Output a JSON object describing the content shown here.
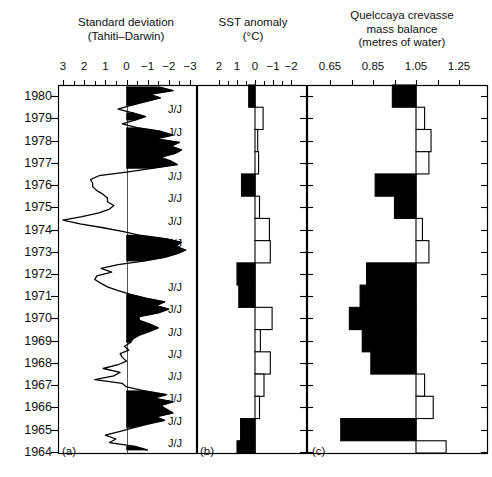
{
  "figure": {
    "panels": [
      {
        "id": "a",
        "label": "(a)",
        "title_line1": "Standard deviation",
        "title_line2": "(Tahiti–Darwin)",
        "title_line3": "",
        "axis_ticks": [
          "3",
          "2",
          "1",
          "0",
          "−1",
          "−2",
          "−3"
        ],
        "axis_values": [
          3,
          2,
          1,
          0,
          -1,
          -2,
          -3
        ],
        "axis_reversed": true,
        "baseline": 0,
        "plot_type": "line-fill"
      },
      {
        "id": "b",
        "label": "(b)",
        "title_line1": "SST anomaly",
        "title_line2": "(°C)",
        "title_line3": "",
        "axis_ticks": [
          "2",
          "1",
          "0",
          "−1",
          "−2"
        ],
        "axis_values": [
          2,
          1,
          0,
          -1,
          -2
        ],
        "axis_reversed": true,
        "baseline": 0,
        "plot_type": "step-bar"
      },
      {
        "id": "c",
        "label": "(c)",
        "title_line1": "Quelccaya crevasse",
        "title_line2": "mass balance",
        "title_line3": "(metres of water)",
        "axis_ticks": [
          "0.65",
          "0.85",
          "1.05",
          "1.25"
        ],
        "axis_values": [
          0.65,
          0.85,
          1.05,
          1.25
        ],
        "axis_reversed": false,
        "baseline": 1.05,
        "plot_type": "step-bar"
      }
    ],
    "years": [
      1980,
      1979,
      1978,
      1977,
      1976,
      1975,
      1974,
      1973,
      1972,
      1971,
      1970,
      1969,
      1968,
      1967,
      1966,
      1965,
      1964
    ],
    "jj_marker_label": "J/J",
    "jj_marker_years": [
      1979,
      1978,
      1976,
      1975,
      1974,
      1973,
      1971,
      1970,
      1969,
      1968,
      1967,
      1966,
      1965,
      1964
    ],
    "colors": {
      "ink": "#000000",
      "paper": "#ffffff",
      "fill_positive": "#000000",
      "fill_negative": "#ffffff"
    }
  },
  "chart_data": [
    {
      "type": "line",
      "panel": "a",
      "title": "Standard deviation (Tahiti–Darwin)",
      "xlabel": "Standard deviation",
      "ylabel": "Year",
      "xlim": [
        3,
        -3
      ],
      "ylim": [
        1964,
        1980.5
      ],
      "grid": false,
      "baseline": 0,
      "note": "Shaded black where value is negative (right of zero line); monthly resolution, values listed oldest-last",
      "x": [
        1980.42,
        1980.25,
        1980.08,
        1979.92,
        1979.75,
        1979.58,
        1979.42,
        1979.25,
        1979.08,
        1978.92,
        1978.75,
        1978.58,
        1978.42,
        1978.25,
        1978.08,
        1977.92,
        1977.75,
        1977.58,
        1977.42,
        1977.25,
        1977.08,
        1976.92,
        1976.75,
        1976.58,
        1976.42,
        1976.25,
        1976.08,
        1975.92,
        1975.75,
        1975.58,
        1975.42,
        1975.25,
        1975.08,
        1974.92,
        1974.75,
        1974.58,
        1974.42,
        1974.25,
        1974.08,
        1973.92,
        1973.75,
        1973.58,
        1973.42,
        1973.25,
        1973.08,
        1972.92,
        1972.75,
        1972.58,
        1972.42,
        1972.25,
        1972.08,
        1971.92,
        1971.75,
        1971.58,
        1971.42,
        1971.25,
        1971.08,
        1970.92,
        1970.75,
        1970.58,
        1970.42,
        1970.25,
        1970.08,
        1969.92,
        1969.75,
        1969.58,
        1969.42,
        1969.25,
        1969.08,
        1968.92,
        1968.75,
        1968.58,
        1968.42,
        1968.25,
        1968.08,
        1967.92,
        1967.75,
        1967.58,
        1967.42,
        1967.25,
        1967.08,
        1966.92,
        1966.75,
        1966.58,
        1966.42,
        1966.25,
        1966.08,
        1965.92,
        1965.75,
        1965.58,
        1965.42,
        1965.25,
        1965.08,
        1964.92,
        1964.75,
        1964.58,
        1964.42,
        1964.25,
        1964.08
      ],
      "values": [
        -1.5,
        -2.2,
        -1.1,
        -1.6,
        -0.9,
        -0.2,
        0.4,
        -0.3,
        -0.9,
        -0.4,
        0.2,
        -0.5,
        -1.6,
        -2.2,
        -1.4,
        -2.5,
        -2.1,
        -2.6,
        -2.3,
        -1.6,
        -2.1,
        -2.4,
        -1.2,
        0.0,
        1.3,
        1.7,
        1.6,
        1.6,
        1.4,
        1.1,
        0.9,
        0.9,
        0.6,
        0.8,
        1.3,
        2.1,
        3.0,
        2.2,
        1.1,
        0.2,
        -0.6,
        -1.9,
        -2.6,
        -2.3,
        -2.8,
        -2.4,
        -1.8,
        -0.8,
        0.4,
        1.2,
        0.7,
        1.4,
        1.5,
        1.2,
        0.9,
        0.4,
        -0.2,
        -0.9,
        -1.8,
        -1.4,
        -2.0,
        -1.5,
        -0.6,
        -0.6,
        -1.1,
        -1.5,
        -1.1,
        -0.6,
        -0.3,
        -0.2,
        0.1,
        -0.1,
        0.3,
        0.2,
        0.0,
        0.4,
        1.1,
        0.3,
        0.6,
        1.5,
        0.2,
        0.0,
        -0.8,
        -1.9,
        -1.3,
        -2.2,
        -1.6,
        -1.9,
        -2.2,
        -1.4,
        -1.8,
        -1.0,
        -0.3,
        0.3,
        1.0,
        0.5,
        0.8,
        -0.4,
        -1.0
      ]
    },
    {
      "type": "bar",
      "panel": "b",
      "title": "SST anomaly (°C)",
      "xlabel": "SST anomaly (°C)",
      "ylabel": "Year",
      "xlim": [
        2,
        -2
      ],
      "ylim": [
        1964,
        1980.5
      ],
      "grid": false,
      "baseline": 0,
      "orientation": "horizontal",
      "note": "One step bar per year; positive values filled black, negative values unfilled",
      "categories": [
        1980,
        1979,
        1978,
        1977,
        1976,
        1975,
        1974,
        1973,
        1972,
        1971,
        1970,
        1969,
        1968,
        1967,
        1966,
        1965,
        1964
      ],
      "values": [
        0.35,
        -0.45,
        -0.15,
        -0.2,
        0.75,
        -0.25,
        -0.8,
        -0.85,
        1.0,
        0.9,
        -0.95,
        -0.3,
        -0.85,
        -0.5,
        -0.25,
        0.8,
        1.0
      ]
    },
    {
      "type": "bar",
      "panel": "c",
      "title": "Quelccaya crevasse mass balance (metres of water)",
      "xlabel": "Quelccaya crevasse mass balance (metres of water)",
      "ylabel": "Year",
      "xlim": [
        0.58,
        1.35
      ],
      "ylim": [
        1964,
        1980.5
      ],
      "grid": false,
      "baseline": 1.05,
      "orientation": "horizontal",
      "note": "Bars drawn from the 1.05 m reference line; bars below 1.05 filled black, bars above 1.05 unfilled",
      "categories": [
        1980,
        1979,
        1978,
        1977,
        1976,
        1975,
        1974,
        1973,
        1972,
        1971,
        1970,
        1969,
        1968,
        1967,
        1966,
        1965,
        1964
      ],
      "values": [
        0.94,
        1.09,
        1.12,
        1.11,
        0.86,
        0.95,
        1.08,
        1.11,
        0.82,
        0.79,
        0.74,
        0.8,
        0.84,
        1.09,
        1.13,
        0.7,
        1.19
      ]
    }
  ]
}
